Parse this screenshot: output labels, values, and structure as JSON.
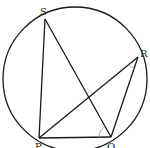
{
  "figure": {
    "top_fragment_text": "",
    "colors": {
      "stroke": "#1a1a1a",
      "angle_mark": "#a0a0a0",
      "label": "#222222",
      "background": "#ffffff"
    },
    "circle": {
      "cx": 75,
      "cy": 79,
      "r": 72
    },
    "points": {
      "S": {
        "label": "S",
        "x": 45,
        "y": 19
      },
      "R": {
        "label": "R",
        "x": 138,
        "y": 57
      },
      "P": {
        "label": "P",
        "x": 39,
        "y": 138
      },
      "Q": {
        "label": "Q",
        "x": 111,
        "y": 137
      }
    },
    "segments": [
      [
        "S",
        "P"
      ],
      [
        "S",
        "Q"
      ],
      [
        "P",
        "R"
      ],
      [
        "P",
        "Q"
      ],
      [
        "R",
        "Q"
      ]
    ],
    "angle_marks": [
      {
        "vertex": "Q",
        "between": [
          "P",
          "S"
        ]
      },
      {
        "vertex": "R",
        "between": [
          "P",
          "Q"
        ]
      }
    ]
  }
}
